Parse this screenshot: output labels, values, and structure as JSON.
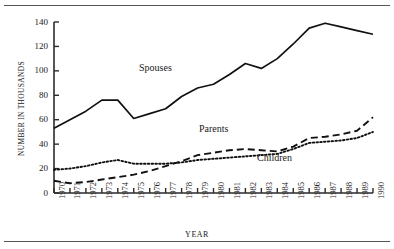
{
  "figure": {
    "top_rule": true,
    "bottom_rule": true,
    "rule_color": "#555555",
    "background": "#ffffff"
  },
  "chart_data": {
    "type": "line",
    "title": "",
    "xlabel": "YEAR",
    "ylabel": "NUMBER IN THOUSANDS",
    "xlim": [
      1970,
      1990
    ],
    "ylim": [
      0,
      140
    ],
    "grid": false,
    "legend_position": "inline-annotations",
    "x": [
      1970,
      1971,
      1972,
      1973,
      1974,
      1975,
      1976,
      1977,
      1978,
      1979,
      1980,
      1981,
      1982,
      1983,
      1984,
      1985,
      1986,
      1987,
      1988,
      1989,
      1990
    ],
    "xticklabels": [
      "1970",
      "1971",
      "1972",
      "1973",
      "1974",
      "1975",
      "1976",
      "1977",
      "1978",
      "1979",
      "1980",
      "1981",
      "1982",
      "1983",
      "1984",
      "1985",
      "1986",
      "1987",
      "1988",
      "1989",
      "1990"
    ],
    "yticks": [
      0,
      20,
      40,
      60,
      80,
      100,
      120,
      140
    ],
    "yticklabels": [
      "0",
      "20",
      "40",
      "60",
      "80",
      "100",
      "120",
      "140"
    ],
    "series": [
      {
        "name": "Spouses",
        "style": "solid",
        "color": "#111111",
        "label_text": "Spouses",
        "values": [
          53,
          60,
          67,
          76,
          76,
          61,
          65,
          69,
          79,
          86,
          89,
          97,
          106,
          102,
          110,
          122,
          135,
          139,
          136,
          133,
          130
        ]
      },
      {
        "name": "Parents",
        "style": "dashed",
        "color": "#111111",
        "label_text": "Parents",
        "values": [
          10,
          8,
          9,
          11,
          13,
          15,
          18,
          22,
          26,
          31,
          33,
          35,
          36,
          35,
          34,
          38,
          45,
          46,
          48,
          51,
          62
        ]
      },
      {
        "name": "Children",
        "style": "dotted",
        "color": "#111111",
        "label_text": "Children",
        "values": [
          19,
          20,
          22,
          25,
          27,
          24,
          24,
          24,
          25,
          27,
          28,
          29,
          30,
          31,
          32,
          36,
          41,
          42,
          43,
          45,
          50
        ]
      }
    ]
  }
}
